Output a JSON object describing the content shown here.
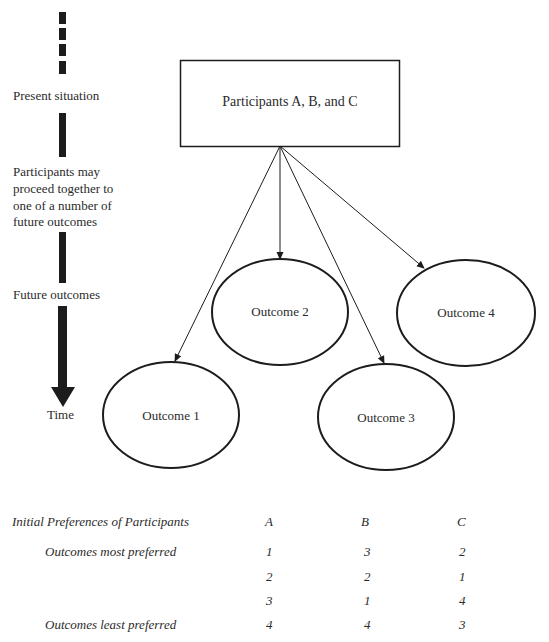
{
  "timeline": {
    "labels": {
      "present": "Present situation",
      "proceed_line1": "Participants may",
      "proceed_line2": "proceed together to",
      "proceed_line3": "one of a number of",
      "proceed_line4": "future outcomes",
      "future": "Future outcomes",
      "time": "Time"
    }
  },
  "diagram": {
    "start_box": {
      "label": "Participants A, B, and C"
    },
    "outcomes": [
      {
        "label": "Outcome 1"
      },
      {
        "label": "Outcome 2"
      },
      {
        "label": "Outcome 3"
      },
      {
        "label": "Outcome 4"
      }
    ],
    "colors": {
      "stroke": "#1c1c1c",
      "text": "#2b2b2b",
      "background": "#ffffff"
    }
  },
  "preferences_table": {
    "title": "Initial Preferences of Participants",
    "columns": [
      "A",
      "B",
      "C"
    ],
    "rows": [
      {
        "label": "Outcomes most preferred",
        "values": [
          "1",
          "3",
          "2"
        ]
      },
      {
        "label": "",
        "values": [
          "2",
          "2",
          "1"
        ]
      },
      {
        "label": "",
        "values": [
          "3",
          "1",
          "4"
        ]
      },
      {
        "label": "Outcomes least preferred",
        "values": [
          "4",
          "4",
          "3"
        ]
      }
    ]
  }
}
